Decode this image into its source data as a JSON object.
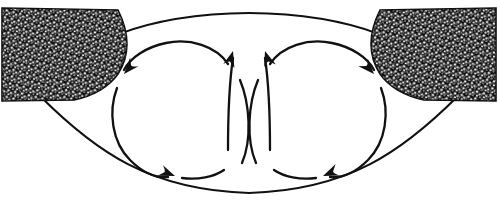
{
  "figure": {
    "canvas": {
      "width": 498,
      "height": 214
    },
    "colors": {
      "ink": "#111111",
      "stipple_dark": "#0d0d0d",
      "stipple_light": "#f2f2f2",
      "background": "#ffffff"
    }
  },
  "body_outline": {
    "name": "lens-shaped-body-outline",
    "top_arc": "M 40,96 C 72,40 150,14 249,13 C 348,14 426,40 458,96",
    "bottom_arc": "M 40,96 C 96,152 150,190 249,193 C 348,190 402,152 458,96",
    "top_arc_label": "upper boundary",
    "bottom_arc_label": "lower boundary"
  },
  "wedges": [
    {
      "name": "stipple-wedge-left",
      "label": "left stippled wedge",
      "side": "left",
      "path": "M 2,8 L 118,10 C 128,30 132,52 118,74 C 108,88 92,96 74,100 L 2,101 Z",
      "texture": "stipple"
    },
    {
      "name": "stipple-wedge-right",
      "label": "right stippled wedge",
      "side": "right",
      "path": "M 496,8 L 380,10 C 370,30 366,52 380,74 C 390,88 406,96 424,100 L 496,101 Z",
      "texture": "stipple"
    }
  ],
  "circulation_cells": [
    {
      "name": "circulation-cell-left",
      "label": "left convection cell",
      "rotation": "counter-clockwise",
      "arc_segments": [
        {
          "name": "left-cell-top-arc",
          "path": "M 228,64 C 216,46 190,38 166,43 C 146,47 130,58 124,70"
        },
        {
          "name": "left-cell-outer-arc",
          "path": "M 117,88 C 108,112 112,142 130,160 C 144,174 158,178 168,177"
        },
        {
          "name": "left-cell-bottom-arc",
          "path": "M 182,178 C 198,180 214,177 224,170"
        },
        {
          "name": "left-cell-inner-arc",
          "path": "M 242,163 C 252,140 250,104 240,80"
        }
      ],
      "arrowheads": [
        {
          "name": "arrowhead-left-cell-upper",
          "tip_x": 124,
          "tip_y": 74,
          "angle_deg": 132,
          "direction": "down-left"
        },
        {
          "name": "arrowhead-left-cell-lower",
          "tip_x": 175,
          "tip_y": 176,
          "angle_deg": 22,
          "direction": "down-right"
        },
        {
          "name": "arrowhead-left-cell-center-up",
          "tip_x": 233,
          "tip_y": 51,
          "angle_deg": -73,
          "direction": "up-right"
        }
      ]
    },
    {
      "name": "circulation-cell-right",
      "label": "right convection cell",
      "rotation": "clockwise",
      "arc_segments": [
        {
          "name": "right-cell-top-arc",
          "path": "M 270,64 C 282,46 308,38 332,43 C 352,47 368,58 374,70"
        },
        {
          "name": "right-cell-outer-arc",
          "path": "M 381,88 C 390,112 386,142 368,160 C 354,174 340,178 330,177"
        },
        {
          "name": "right-cell-bottom-arc",
          "path": "M 316,178 C 300,180 284,177 274,170"
        },
        {
          "name": "right-cell-inner-arc",
          "path": "M 256,163 C 246,140 248,104 258,80"
        }
      ],
      "arrowheads": [
        {
          "name": "arrowhead-right-cell-upper",
          "tip_x": 374,
          "tip_y": 74,
          "angle_deg": 48,
          "direction": "down-right"
        },
        {
          "name": "arrowhead-right-cell-lower",
          "tip_x": 323,
          "tip_y": 176,
          "angle_deg": 158,
          "direction": "down-left"
        },
        {
          "name": "arrowhead-right-cell-center-up",
          "tip_x": 265,
          "tip_y": 51,
          "angle_deg": -107,
          "direction": "up-left"
        }
      ]
    }
  ],
  "central_upwelling": {
    "name": "central-upwelling",
    "label": "central rising flow",
    "left_branch": "M 228,150 C 228,110 230,78 233,58",
    "right_branch": "M 270,150 C 270,110 268,78 265,58"
  }
}
